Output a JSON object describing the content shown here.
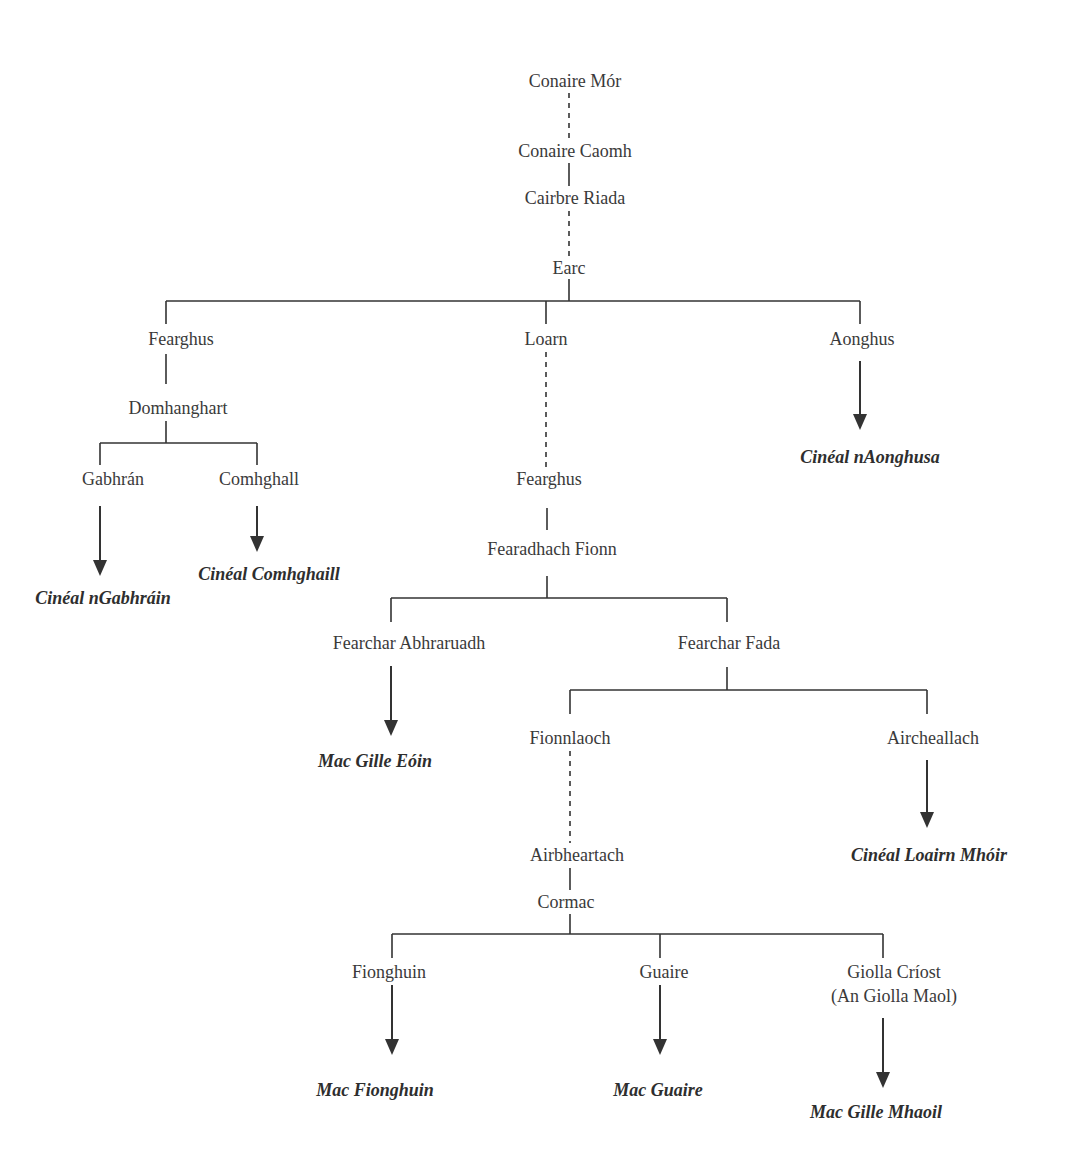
{
  "colors": {
    "line": "#333333",
    "text": "#3a3a3a",
    "background": "#ffffff"
  },
  "nodes": [
    {
      "id": "conaire_mor",
      "label": "Conaire Mór",
      "x": 575,
      "y": 81,
      "kind": "person"
    },
    {
      "id": "conaire_caomh",
      "label": "Conaire Caomh",
      "x": 575,
      "y": 151,
      "kind": "person"
    },
    {
      "id": "cairbre_riada",
      "label": "Cairbre Riada",
      "x": 575,
      "y": 198,
      "kind": "person"
    },
    {
      "id": "earc",
      "label": "Earc",
      "x": 569,
      "y": 268,
      "kind": "person"
    },
    {
      "id": "fearghus_1",
      "label": "Fearghus",
      "x": 181,
      "y": 339,
      "kind": "person"
    },
    {
      "id": "loarn",
      "label": "Loarn",
      "x": 546,
      "y": 339,
      "kind": "person"
    },
    {
      "id": "aonghus",
      "label": "Aonghus",
      "x": 862,
      "y": 339,
      "kind": "person"
    },
    {
      "id": "domhanghart",
      "label": "Domhanghart",
      "x": 178,
      "y": 408,
      "kind": "person"
    },
    {
      "id": "gabhran",
      "label": "Gabhrán",
      "x": 113,
      "y": 479,
      "kind": "person"
    },
    {
      "id": "comhghall",
      "label": "Comhghall",
      "x": 259,
      "y": 479,
      "kind": "person"
    },
    {
      "id": "fearghus_2",
      "label": "Fearghus",
      "x": 549,
      "y": 479,
      "kind": "person"
    },
    {
      "id": "cineal_ngabhrain",
      "label": "Cinéal nGabhráin",
      "x": 103,
      "y": 598,
      "kind": "lineage"
    },
    {
      "id": "cineal_comhghaill",
      "label": "Cinéal Comhghaill",
      "x": 269,
      "y": 574,
      "kind": "lineage"
    },
    {
      "id": "cineal_naonghusa",
      "label": "Cinéal nAonghusa",
      "x": 870,
      "y": 457,
      "kind": "lineage"
    },
    {
      "id": "fearadhach_fionn",
      "label": "Fearadhach Fionn",
      "x": 552,
      "y": 549,
      "kind": "person"
    },
    {
      "id": "fearchar_abhraruadh",
      "label": "Fearchar Abhraruadh",
      "x": 409,
      "y": 643,
      "kind": "person"
    },
    {
      "id": "fearchar_fada",
      "label": "Fearchar Fada",
      "x": 729,
      "y": 643,
      "kind": "person"
    },
    {
      "id": "mac_gille_eoin",
      "label": "Mac Gille Eóin",
      "x": 375,
      "y": 761,
      "kind": "lineage"
    },
    {
      "id": "fionnlaoch",
      "label": "Fionnlaoch",
      "x": 570,
      "y": 738,
      "kind": "person"
    },
    {
      "id": "aircheallach",
      "label": "Aircheallach",
      "x": 933,
      "y": 738,
      "kind": "person"
    },
    {
      "id": "cineal_loairn_mhoir",
      "label": "Cinéal Loairn Mhóir",
      "x": 929,
      "y": 855,
      "kind": "lineage"
    },
    {
      "id": "airbheartach",
      "label": "Airbheartach",
      "x": 577,
      "y": 855,
      "kind": "person"
    },
    {
      "id": "cormac",
      "label": "Cormac",
      "x": 566,
      "y": 902,
      "kind": "person"
    },
    {
      "id": "fionghuin",
      "label": "Fionghuin",
      "x": 389,
      "y": 972,
      "kind": "person"
    },
    {
      "id": "guaire",
      "label": "Guaire",
      "x": 664,
      "y": 972,
      "kind": "person"
    },
    {
      "id": "giolla_criost",
      "label": "Giolla Críost",
      "x": 894,
      "y": 972,
      "kind": "person"
    },
    {
      "id": "giolla_criost_alias",
      "label": "(An Giolla Maol)",
      "x": 894,
      "y": 996,
      "kind": "person"
    },
    {
      "id": "mac_fionghuin",
      "label": "Mac Fionghuin",
      "x": 375,
      "y": 1090,
      "kind": "lineage"
    },
    {
      "id": "mac_guaire",
      "label": "Mac Guaire",
      "x": 658,
      "y": 1090,
      "kind": "lineage"
    },
    {
      "id": "mac_gille_mhaoil",
      "label": "Mac Gille Mhaoil",
      "x": 876,
      "y": 1112,
      "kind": "lineage"
    }
  ],
  "dashed_lines": [
    {
      "x1": 569,
      "y1": 93,
      "x2": 569,
      "y2": 139
    },
    {
      "x1": 569,
      "y1": 211,
      "x2": 569,
      "y2": 256
    },
    {
      "x1": 546,
      "y1": 352,
      "x2": 546,
      "y2": 467
    },
    {
      "x1": 570,
      "y1": 751,
      "x2": 570,
      "y2": 843
    }
  ],
  "solid_lines": [
    {
      "x1": 569,
      "y1": 163,
      "x2": 569,
      "y2": 186
    },
    {
      "x1": 569,
      "y1": 279,
      "x2": 569,
      "y2": 301
    },
    {
      "x1": 166,
      "y1": 301,
      "x2": 860,
      "y2": 301
    },
    {
      "x1": 166,
      "y1": 301,
      "x2": 166,
      "y2": 324
    },
    {
      "x1": 546,
      "y1": 301,
      "x2": 546,
      "y2": 324
    },
    {
      "x1": 860,
      "y1": 301,
      "x2": 860,
      "y2": 324
    },
    {
      "x1": 166,
      "y1": 354,
      "x2": 166,
      "y2": 384
    },
    {
      "x1": 166,
      "y1": 421,
      "x2": 166,
      "y2": 443
    },
    {
      "x1": 100,
      "y1": 443,
      "x2": 257,
      "y2": 443
    },
    {
      "x1": 100,
      "y1": 443,
      "x2": 100,
      "y2": 465
    },
    {
      "x1": 257,
      "y1": 443,
      "x2": 257,
      "y2": 465
    },
    {
      "x1": 547,
      "y1": 508,
      "x2": 547,
      "y2": 530
    },
    {
      "x1": 547,
      "y1": 576,
      "x2": 547,
      "y2": 598
    },
    {
      "x1": 391,
      "y1": 598,
      "x2": 727,
      "y2": 598
    },
    {
      "x1": 391,
      "y1": 598,
      "x2": 391,
      "y2": 622
    },
    {
      "x1": 727,
      "y1": 598,
      "x2": 727,
      "y2": 622
    },
    {
      "x1": 727,
      "y1": 667,
      "x2": 727,
      "y2": 690
    },
    {
      "x1": 570,
      "y1": 690,
      "x2": 927,
      "y2": 690
    },
    {
      "x1": 570,
      "y1": 690,
      "x2": 570,
      "y2": 714
    },
    {
      "x1": 927,
      "y1": 690,
      "x2": 927,
      "y2": 714
    },
    {
      "x1": 570,
      "y1": 868,
      "x2": 570,
      "y2": 890
    },
    {
      "x1": 570,
      "y1": 914,
      "x2": 570,
      "y2": 934
    },
    {
      "x1": 392,
      "y1": 934,
      "x2": 883,
      "y2": 934
    },
    {
      "x1": 392,
      "y1": 934,
      "x2": 392,
      "y2": 958
    },
    {
      "x1": 660,
      "y1": 934,
      "x2": 660,
      "y2": 958
    },
    {
      "x1": 883,
      "y1": 934,
      "x2": 883,
      "y2": 958
    }
  ],
  "arrows": [
    {
      "x": 860,
      "y1": 361,
      "y2": 430
    },
    {
      "x": 100,
      "y1": 506,
      "y2": 576
    },
    {
      "x": 257,
      "y1": 506,
      "y2": 552
    },
    {
      "x": 391,
      "y1": 666,
      "y2": 736
    },
    {
      "x": 927,
      "y1": 760,
      "y2": 828
    },
    {
      "x": 392,
      "y1": 985,
      "y2": 1055
    },
    {
      "x": 660,
      "y1": 985,
      "y2": 1055
    },
    {
      "x": 883,
      "y1": 1018,
      "y2": 1088
    }
  ]
}
